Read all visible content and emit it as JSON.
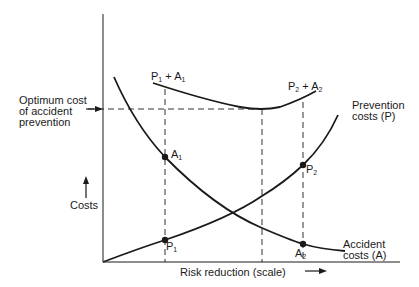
{
  "diagram": {
    "axes": {
      "x_label": "Risk reduction (scale)",
      "y_label": "Costs"
    },
    "annotations": {
      "optimum_line1": "Optimum cost",
      "optimum_line2": "of accident",
      "optimum_line3": "prevention"
    },
    "curves": {
      "total1_main": "P",
      "total1_sub1": "1",
      "total1_plus": " + A",
      "total1_sub2": "1",
      "total2_main": "P",
      "total2_sub1": "2",
      "total2_plus": " + A",
      "total2_sub2": "2",
      "prevention_line1": "Prevention",
      "prevention_line2": "costs (P)",
      "accident_line1": "Accident",
      "accident_line2": "costs (A)"
    },
    "points": {
      "a1_main": "A",
      "a1_sub": "1",
      "p1_main": "P",
      "p1_sub": "1",
      "p2_main": "P",
      "p2_sub": "2",
      "a2_main": "A",
      "a2_sub": "2"
    },
    "colors": {
      "ink": "#1a1a1a",
      "background": "#ffffff"
    }
  }
}
